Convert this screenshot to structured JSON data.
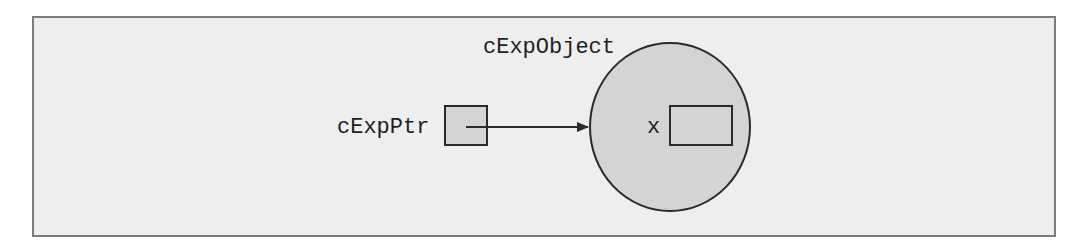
{
  "diagram": {
    "type": "pointer-to-object",
    "colors": {
      "frame_background": "#eeeeee",
      "frame_border": "#7c7c7c",
      "shape_fill": "#d4d4d4",
      "stroke": "#2a2a2a",
      "text": "#1e1e1e"
    },
    "pointer": {
      "label": "cExpPtr"
    },
    "object": {
      "label": "cExpObject",
      "member": {
        "label": "x"
      }
    },
    "edges": [
      {
        "from": "cExpPtr",
        "to": "cExpObject",
        "style": "arrow"
      }
    ]
  }
}
